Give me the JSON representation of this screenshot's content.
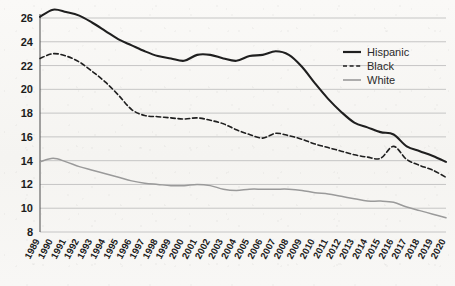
{
  "chart_data": {
    "type": "line",
    "title": "",
    "subtitle": "",
    "xlabel": "",
    "ylabel": "",
    "xlim": [
      1989,
      2020
    ],
    "ylim": [
      8,
      26
    ],
    "grid": "horizontal",
    "legend_position": "top-right",
    "x": [
      1989,
      1990,
      1991,
      1992,
      1993,
      1994,
      1995,
      1996,
      1997,
      1998,
      1999,
      2000,
      2001,
      2002,
      2003,
      2004,
      2005,
      2006,
      2007,
      2008,
      2009,
      2010,
      2011,
      2012,
      2013,
      2014,
      2015,
      2016,
      2017,
      2018,
      2019,
      2020
    ],
    "categories": [
      "1989",
      "1990",
      "1991",
      "1992",
      "1993",
      "1994",
      "1995",
      "1996",
      "1997",
      "1998",
      "1999",
      "2000",
      "2001",
      "2002",
      "2003",
      "2004",
      "2005",
      "2006",
      "2007",
      "2008",
      "2009",
      "2010",
      "2011",
      "2012",
      "2013",
      "2014",
      "2015",
      "2016",
      "2017",
      "2018",
      "2019",
      "2020"
    ],
    "yticks": [
      8,
      10,
      12,
      14,
      16,
      18,
      20,
      22,
      24,
      26
    ],
    "series": [
      {
        "name": "Hispanic",
        "style": "solid",
        "color": "#1f1f1f",
        "width": 2.1,
        "values": [
          26.1,
          26.7,
          26.5,
          26.2,
          25.6,
          24.9,
          24.2,
          23.7,
          23.2,
          22.8,
          22.6,
          22.4,
          22.9,
          22.9,
          22.6,
          22.4,
          22.8,
          22.9,
          23.2,
          22.9,
          21.9,
          20.5,
          19.2,
          18.1,
          17.2,
          16.8,
          16.4,
          16.2,
          15.2,
          14.8,
          14.4,
          13.9
        ]
      },
      {
        "name": "Black",
        "style": "dashed",
        "color": "#1f1f1f",
        "width": 1.6,
        "values": [
          22.6,
          23.0,
          22.8,
          22.3,
          21.5,
          20.6,
          19.5,
          18.3,
          17.8,
          17.7,
          17.6,
          17.5,
          17.6,
          17.4,
          17.1,
          16.6,
          16.2,
          15.9,
          16.3,
          16.1,
          15.8,
          15.4,
          15.1,
          14.8,
          14.5,
          14.3,
          14.2,
          15.2,
          14.1,
          13.6,
          13.2,
          12.6
        ]
      },
      {
        "name": "White",
        "style": "solid",
        "color": "#9a9a9a",
        "width": 1.5,
        "values": [
          13.9,
          14.2,
          13.9,
          13.5,
          13.2,
          12.9,
          12.6,
          12.3,
          12.1,
          12.0,
          11.9,
          11.9,
          12.0,
          11.9,
          11.6,
          11.5,
          11.6,
          11.6,
          11.6,
          11.6,
          11.5,
          11.3,
          11.2,
          11.0,
          10.8,
          10.6,
          10.6,
          10.5,
          10.1,
          9.8,
          9.5,
          9.2
        ]
      }
    ]
  },
  "legend": {
    "entries": [
      {
        "label": "Hispanic",
        "style": "solid",
        "color": "#1f1f1f"
      },
      {
        "label": "Black",
        "style": "dashed",
        "color": "#1f1f1f"
      },
      {
        "label": "White",
        "style": "solid",
        "color": "#9a9a9a"
      }
    ]
  }
}
